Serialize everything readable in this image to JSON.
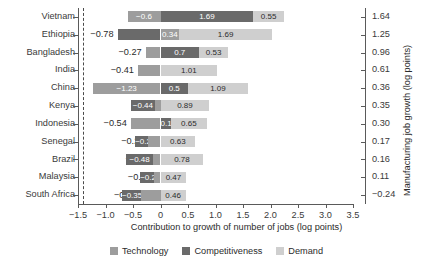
{
  "chart_data": {
    "type": "bar",
    "orientation": "horizontal",
    "stacked": true,
    "title": "",
    "xlabel": "Contribution to growth of number of jobs (log points)",
    "ylabel": "",
    "y2label": "Manufacturing job growth (log points)",
    "xlim": [
      -1.5,
      3.5
    ],
    "xticks": [
      -1.5,
      -1.0,
      -0.5,
      0,
      0.5,
      1.0,
      1.5,
      2.0,
      2.5,
      3.0,
      3.5
    ],
    "xtick_labels": [
      "−1.5",
      "−1.0",
      "−0.5",
      "0",
      "0.5",
      "1.0",
      "1.5",
      "2.0",
      "2.5",
      "3.0",
      "3.5"
    ],
    "grid": false,
    "zero_reference_line": 0,
    "legend_position": "bottom",
    "categories": [
      "Vietnam",
      "Ethiopia",
      "Bangladesh",
      "India",
      "China",
      "Kenya",
      "Indonesia",
      "Senegal",
      "Brazil",
      "Malaysia",
      "South Africa"
    ],
    "right_axis_values": [
      "1.64",
      "1.25",
      "0.96",
      "0.61",
      "0.36",
      "0.35",
      "0.30",
      "0.17",
      "0.16",
      "0.11",
      "−0.24"
    ],
    "series": [
      {
        "name": "Technology",
        "color": "#9d9d9d",
        "values": [
          -0.6,
          0.34,
          -0.27,
          -0.41,
          -1.23,
          -0.1,
          -0.54,
          -0.22,
          -0.14,
          -0.11,
          -0.35
        ],
        "labels": [
          "−0.6",
          "0.34",
          "−0.27",
          "−0.41",
          "−1.23",
          "−0.1",
          "−0.54",
          "−0.22",
          "−0.14",
          "−0.11",
          "−0.35"
        ]
      },
      {
        "name": "Competitiveness",
        "color": "#6a6a6a",
        "values": [
          1.69,
          -0.78,
          0.7,
          0.01,
          0.5,
          -0.44,
          0.19,
          -0.24,
          -0.48,
          -0.26,
          -0.35
        ],
        "labels": [
          "1.69",
          "−0.78",
          "0.7",
          "0.01",
          "0.5",
          "−0.44",
          "0.19",
          "−0.24",
          "−0.48",
          "−0.26",
          "−0.35"
        ]
      },
      {
        "name": "Demand",
        "color": "#cfcfcf",
        "values": [
          0.55,
          1.69,
          0.53,
          1.01,
          1.09,
          0.89,
          0.65,
          0.63,
          0.78,
          0.47,
          0.46
        ],
        "labels": [
          "0.55",
          "1.69",
          "0.53",
          "1.01",
          "1.09",
          "0.89",
          "0.65",
          "0.63",
          "0.78",
          "0.47",
          "0.46"
        ]
      }
    ],
    "rows": [
      {
        "category": "Vietnam",
        "right": "1.64",
        "neg": [
          {
            "series": "Technology",
            "value": -0.6,
            "label": "−0.6",
            "inside": true
          }
        ],
        "pos": [
          {
            "series": "Competitiveness",
            "value": 1.69,
            "label": "1.69",
            "inside": true
          },
          {
            "series": "Demand",
            "value": 0.55,
            "label": "0.55",
            "inside": true
          }
        ]
      },
      {
        "category": "Ethiopia",
        "right": "1.25",
        "neg": [
          {
            "series": "Competitiveness",
            "value": -0.78,
            "label": "−0.78",
            "inside": false
          }
        ],
        "pos": [
          {
            "series": "Technology",
            "value": 0.34,
            "label": "0.34",
            "inside": true
          },
          {
            "series": "Demand",
            "value": 1.69,
            "label": "1.69",
            "inside": true
          }
        ]
      },
      {
        "category": "Bangladesh",
        "right": "0.96",
        "neg": [
          {
            "series": "Technology",
            "value": -0.27,
            "label": "−0.27",
            "inside": false
          }
        ],
        "pos": [
          {
            "series": "Competitiveness",
            "value": 0.7,
            "label": "0.7",
            "inside": true
          },
          {
            "series": "Demand",
            "value": 0.53,
            "label": "0.53",
            "inside": true
          }
        ]
      },
      {
        "category": "India",
        "right": "0.61",
        "neg": [
          {
            "series": "Technology",
            "value": -0.41,
            "label": "−0.41",
            "inside": false
          }
        ],
        "pos": [
          {
            "series": "Competitiveness",
            "value": 0.01,
            "label": "0.01",
            "inside": true
          },
          {
            "series": "Demand",
            "value": 1.01,
            "label": "1.01",
            "inside": true
          }
        ]
      },
      {
        "category": "China",
        "right": "0.36",
        "neg": [
          {
            "series": "Technology",
            "value": -1.23,
            "label": "−1.23",
            "inside": true
          }
        ],
        "pos": [
          {
            "series": "Competitiveness",
            "value": 0.5,
            "label": "0.5",
            "inside": true
          },
          {
            "series": "Demand",
            "value": 1.09,
            "label": "1.09",
            "inside": true
          }
        ]
      },
      {
        "category": "Kenya",
        "right": "0.35",
        "neg": [
          {
            "series": "Technology",
            "value": -0.1,
            "label": "−0.1",
            "inside": false
          },
          {
            "series": "Competitiveness",
            "value": -0.44,
            "label": "−0.44",
            "inside": true
          }
        ],
        "pos": [
          {
            "series": "Demand",
            "value": 0.89,
            "label": "0.89",
            "inside": true
          }
        ]
      },
      {
        "category": "Indonesia",
        "right": "0.30",
        "neg": [
          {
            "series": "Technology",
            "value": -0.54,
            "label": "−0.54",
            "inside": false
          }
        ],
        "pos": [
          {
            "series": "Competitiveness",
            "value": 0.19,
            "label": "0.19",
            "inside": true
          },
          {
            "series": "Demand",
            "value": 0.65,
            "label": "0.65",
            "inside": true
          }
        ]
      },
      {
        "category": "Senegal",
        "right": "0.17",
        "neg": [
          {
            "series": "Technology",
            "value": -0.22,
            "label": "−0.22",
            "inside": false
          },
          {
            "series": "Competitiveness",
            "value": -0.24,
            "label": "−0.24",
            "inside": true
          }
        ],
        "pos": [
          {
            "series": "Demand",
            "value": 0.63,
            "label": "0.63",
            "inside": true
          }
        ]
      },
      {
        "category": "Brazil",
        "right": "0.16",
        "neg": [
          {
            "series": "Technology",
            "value": -0.14,
            "label": "−0.14",
            "inside": false
          },
          {
            "series": "Competitiveness",
            "value": -0.48,
            "label": "−0.48",
            "inside": true
          }
        ],
        "pos": [
          {
            "series": "Demand",
            "value": 0.78,
            "label": "0.78",
            "inside": true
          }
        ]
      },
      {
        "category": "Malaysia",
        "right": "0.11",
        "neg": [
          {
            "series": "Technology",
            "value": -0.11,
            "label": "−0.11",
            "inside": false
          },
          {
            "series": "Competitiveness",
            "value": -0.26,
            "label": "−0.26",
            "inside": true
          }
        ],
        "pos": [
          {
            "series": "Demand",
            "value": 0.47,
            "label": "0.47",
            "inside": true
          }
        ]
      },
      {
        "category": "South Africa",
        "right": "−0.24",
        "neg": [
          {
            "series": "Technology",
            "value": -0.35,
            "label": "−0.35",
            "inside": false
          },
          {
            "series": "Competitiveness",
            "value": -0.35,
            "label": "−0.35",
            "inside": true
          }
        ],
        "pos": [
          {
            "series": "Demand",
            "value": 0.46,
            "label": "0.46",
            "inside": true
          }
        ]
      }
    ],
    "legend": [
      {
        "label": "Technology",
        "color": "#9d9d9d"
      },
      {
        "label": "Competitiveness",
        "color": "#6a6a6a"
      },
      {
        "label": "Demand",
        "color": "#cfcfcf"
      }
    ]
  }
}
